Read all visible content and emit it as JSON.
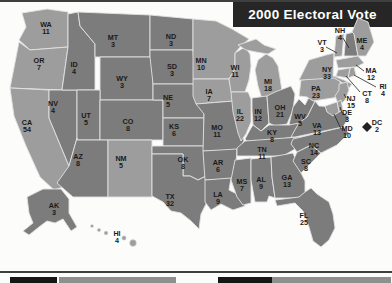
{
  "title": "2000 Electoral Vote",
  "colors": {
    "state_dark": "#7c7c7c",
    "state_light": "#9d9d9d",
    "state_border": "#e2e2e2",
    "label_text": "#1a1a1a",
    "title_bg": "#262626",
    "title_text": "#ffffff",
    "frame_line": "#3f3f3f",
    "callout_line": "#222222",
    "dc_marker": "#222222",
    "legend_dark": "#161616",
    "legend_mid": "#8f8f8f",
    "background": "#fcfcfb"
  },
  "map": {
    "states": [
      {
        "abbr": "WA",
        "votes": 11,
        "shade": "light"
      },
      {
        "abbr": "OR",
        "votes": 7,
        "shade": "light"
      },
      {
        "abbr": "CA",
        "votes": 54,
        "shade": "light"
      },
      {
        "abbr": "NV",
        "votes": 4,
        "shade": "dark"
      },
      {
        "abbr": "ID",
        "votes": 4,
        "shade": "dark"
      },
      {
        "abbr": "MT",
        "votes": 3,
        "shade": "dark"
      },
      {
        "abbr": "WY",
        "votes": 3,
        "shade": "dark"
      },
      {
        "abbr": "UT",
        "votes": 5,
        "shade": "dark"
      },
      {
        "abbr": "CO",
        "votes": 8,
        "shade": "dark"
      },
      {
        "abbr": "AZ",
        "votes": 8,
        "shade": "dark"
      },
      {
        "abbr": "NM",
        "votes": 5,
        "shade": "light"
      },
      {
        "abbr": "ND",
        "votes": 3,
        "shade": "dark"
      },
      {
        "abbr": "SD",
        "votes": 3,
        "shade": "dark"
      },
      {
        "abbr": "NE",
        "votes": 5,
        "shade": "dark"
      },
      {
        "abbr": "KS",
        "votes": 6,
        "shade": "dark"
      },
      {
        "abbr": "OK",
        "votes": 8,
        "shade": "dark"
      },
      {
        "abbr": "TX",
        "votes": 32,
        "shade": "dark"
      },
      {
        "abbr": "MN",
        "votes": 10,
        "shade": "light"
      },
      {
        "abbr": "IA",
        "votes": 7,
        "shade": "light"
      },
      {
        "abbr": "MO",
        "votes": 11,
        "shade": "dark"
      },
      {
        "abbr": "AR",
        "votes": 6,
        "shade": "dark"
      },
      {
        "abbr": "LA",
        "votes": 9,
        "shade": "dark"
      },
      {
        "abbr": "WI",
        "votes": 11,
        "shade": "light"
      },
      {
        "abbr": "IL",
        "votes": 22,
        "shade": "light"
      },
      {
        "abbr": "MI",
        "votes": 18,
        "shade": "light"
      },
      {
        "abbr": "IN",
        "votes": 12,
        "shade": "dark"
      },
      {
        "abbr": "OH",
        "votes": 21,
        "shade": "dark"
      },
      {
        "abbr": "KY",
        "votes": 8,
        "shade": "dark"
      },
      {
        "abbr": "TN",
        "votes": 11,
        "shade": "dark"
      },
      {
        "abbr": "MS",
        "votes": 7,
        "shade": "dark"
      },
      {
        "abbr": "AL",
        "votes": 9,
        "shade": "dark"
      },
      {
        "abbr": "GA",
        "votes": 13,
        "shade": "dark"
      },
      {
        "abbr": "FL",
        "votes": 25,
        "shade": "dark"
      },
      {
        "abbr": "SC",
        "votes": 8,
        "shade": "dark"
      },
      {
        "abbr": "NC",
        "votes": 14,
        "shade": "dark"
      },
      {
        "abbr": "VA",
        "votes": 13,
        "shade": "dark"
      },
      {
        "abbr": "WV",
        "votes": 5,
        "shade": "dark"
      },
      {
        "abbr": "PA",
        "votes": 23,
        "shade": "light"
      },
      {
        "abbr": "NY",
        "votes": 33,
        "shade": "light"
      },
      {
        "abbr": "VT",
        "votes": 3,
        "shade": "light"
      },
      {
        "abbr": "NH",
        "votes": 4,
        "shade": "dark"
      },
      {
        "abbr": "ME",
        "votes": 4,
        "shade": "light"
      },
      {
        "abbr": "MA",
        "votes": 12,
        "shade": "light"
      },
      {
        "abbr": "RI",
        "votes": 4,
        "shade": "light"
      },
      {
        "abbr": "CT",
        "votes": 8,
        "shade": "light"
      },
      {
        "abbr": "NJ",
        "votes": 15,
        "shade": "light"
      },
      {
        "abbr": "DE",
        "votes": 3,
        "shade": "light"
      },
      {
        "abbr": "MD",
        "votes": 10,
        "shade": "light"
      },
      {
        "abbr": "DC",
        "votes": 2,
        "shade": "light",
        "marker_icon": "diamond-icon"
      },
      {
        "abbr": "AK",
        "votes": 3,
        "shade": "dark"
      },
      {
        "abbr": "HI",
        "votes": 4,
        "shade": "light"
      }
    ]
  },
  "legend": {
    "bars": [
      {
        "tone": "dark"
      },
      {
        "tone": "mid"
      },
      {
        "tone": "dark"
      },
      {
        "tone": "mid"
      }
    ]
  }
}
